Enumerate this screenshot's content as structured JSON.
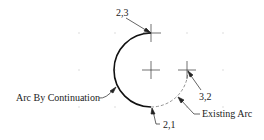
{
  "diagram": {
    "type": "arc-construction",
    "grid": {
      "xs": [
        79,
        115,
        151,
        187,
        223
      ],
      "ys": [
        33,
        70,
        107
      ],
      "color": "#bbbbbb"
    },
    "center": {
      "x": 151,
      "y": 70
    },
    "radius": 37,
    "points": {
      "p23": {
        "label": "2,3",
        "x": 151,
        "y": 33
      },
      "p32": {
        "label": "3,2",
        "x": 187,
        "y": 70
      },
      "p21": {
        "label": "2,1",
        "x": 151,
        "y": 107
      }
    },
    "labels": {
      "arc_by_continuation": "Arc By Continuation",
      "existing_arc": "Existing Arc"
    },
    "colors": {
      "line": "#111111",
      "dashed": "#666666"
    }
  }
}
